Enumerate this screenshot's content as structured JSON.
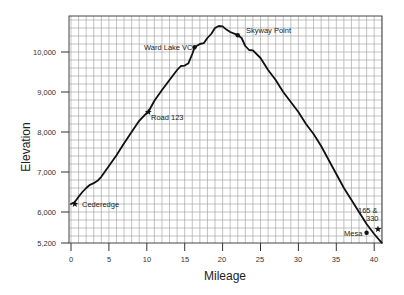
{
  "chart_data": {
    "type": "line",
    "title": "",
    "xlabel": "Mileage",
    "ylabel": "Elevation",
    "xlim": [
      0,
      41
    ],
    "ylim": [
      5200,
      10900
    ],
    "grid": true,
    "x_ticks": [
      0,
      5,
      10,
      15,
      20,
      25,
      30,
      35,
      40
    ],
    "x_tick_labels": [
      "0",
      "5",
      "10",
      "15",
      "20",
      "25",
      "30",
      "35",
      "40"
    ],
    "y_ticks": [
      5200,
      6000,
      7000,
      8000,
      9000,
      10000
    ],
    "y_tick_labels": [
      "5,200",
      "6,000",
      "7,000",
      "8,000",
      "9,000",
      "10,000"
    ],
    "series": [
      {
        "name": "Elevation profile",
        "x": [
          0,
          0.5,
          1,
          1.5,
          2,
          2.5,
          3,
          3.5,
          4,
          5,
          6,
          7,
          8,
          9,
          10,
          10.2,
          11,
          12,
          13,
          14,
          14.5,
          15,
          15.5,
          16,
          16.3,
          17,
          17.5,
          18,
          18.5,
          19,
          19.5,
          20,
          20.5,
          21,
          22,
          22.5,
          23,
          23.5,
          24,
          25,
          26,
          27,
          28,
          29,
          30,
          31,
          32,
          33,
          34,
          35,
          36,
          37,
          38,
          39,
          40,
          41
        ],
        "y": [
          6200,
          6250,
          6380,
          6500,
          6600,
          6680,
          6720,
          6780,
          6880,
          7150,
          7420,
          7720,
          8000,
          8280,
          8480,
          8500,
          8780,
          9050,
          9300,
          9550,
          9650,
          9660,
          9720,
          9950,
          10120,
          10200,
          10220,
          10350,
          10450,
          10600,
          10650,
          10640,
          10560,
          10500,
          10420,
          10350,
          10150,
          10050,
          10040,
          9850,
          9550,
          9300,
          9000,
          8750,
          8500,
          8200,
          7950,
          7650,
          7300,
          6950,
          6600,
          6300,
          6000,
          5700,
          5450,
          5230
        ]
      }
    ],
    "annotations": [
      {
        "label": "Cederedge",
        "x": 0.5,
        "y": 6200,
        "marker": "star"
      },
      {
        "label": "Road 123",
        "x": 10.2,
        "y": 8500,
        "marker": "star"
      },
      {
        "label": "Ward Lake VC",
        "x": 16.3,
        "y": 10120,
        "marker": "dot"
      },
      {
        "label": "Skyway Point",
        "x": 22,
        "y": 10420,
        "marker": "dot"
      },
      {
        "label": "Mesa",
        "x": 39,
        "y": 5480,
        "marker": "dot"
      },
      {
        "label": "165 & 330",
        "x": 40.5,
        "y": 5570,
        "marker": "star"
      }
    ]
  },
  "labels": {
    "xlabel": "Mileage",
    "ylabel": "Elevation",
    "x_ticks": [
      "0",
      "5",
      "10",
      "15",
      "20",
      "25",
      "30",
      "35",
      "40"
    ],
    "y_ticks": [
      "10,000",
      "9,000",
      "8,000",
      "7,000",
      "6,000",
      "5,200"
    ],
    "annotations": {
      "cederedge": "Cederedge",
      "road123": "Road 123",
      "wardlake": "Ward Lake VC",
      "skyway": "Skyway Point",
      "mesa": "Mesa",
      "junction_line1": "165 &",
      "junction_line2": "330"
    }
  },
  "colors": {
    "line": "#111111",
    "grid": "#9a9a9a",
    "frame": "#444444",
    "background": "#ffffff"
  }
}
